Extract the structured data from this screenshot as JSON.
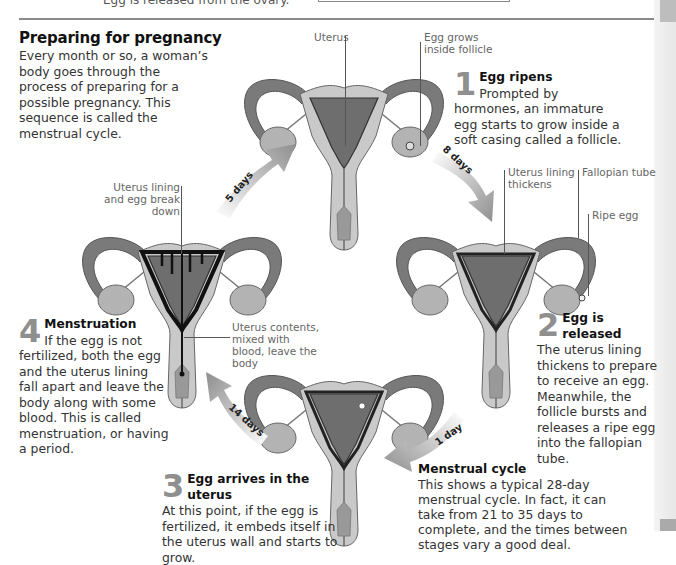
{
  "header": {
    "cut_text": "Egg is released from the ovary.",
    "title": "Preparing for pregnancy",
    "intro": "Every month or so, a woman’s body goes through the process of preparing for a possible pregnancy. This sequence is called the menstrual cycle."
  },
  "labels": {
    "uterus": "Uterus",
    "egg_grows": "Egg grows inside follicle",
    "lining_thickens": "Uterus lining thickens",
    "fallopian_tube": "Fallopian tube",
    "ripe_egg": "Ripe egg",
    "lining_breakdown": "Uterus lining and egg break down",
    "contents_leave": "Uterus contents, mixed with blood, leave the body"
  },
  "steps": [
    {
      "number": "1",
      "title": "Egg ripens",
      "body": "Prompted by hormones, an immature egg starts to grow inside a soft casing called a follicle."
    },
    {
      "number": "2",
      "title": "Egg is released",
      "body": "The uterus lining thickens to prepare to receive an egg. Meanwhile, the follicle bursts and releases a ripe egg into the fallopian tube."
    },
    {
      "number": "3",
      "title": "Egg arrives in the uterus",
      "body": "At this point, if the egg is fertilized, it embeds itself in the uterus wall and starts to grow."
    },
    {
      "number": "4",
      "title": "Menstruation",
      "body": "If the egg is not fertilized, both the egg and the uterus lining fall apart and leave the body along with some blood. This is called menstruation, or having a period."
    }
  ],
  "arrows": [
    {
      "label": "5 days",
      "from": "4",
      "to": "1"
    },
    {
      "label": "8 days",
      "from": "1",
      "to": "2"
    },
    {
      "label": "1 day",
      "from": "2",
      "to": "3"
    },
    {
      "label": "14 days",
      "from": "3",
      "to": "4"
    }
  ],
  "caption": {
    "title": "Menstrual cycle",
    "body": "This shows a typical 28-day menstrual cycle. In fact, it can take from 21 to 35 days to complete, and the times between stages vary a good deal."
  },
  "colors": {
    "tube": "#7a7a7a",
    "tissue": "#c9c9c9",
    "cavity": "#6e6e6e",
    "ovary": "#b3b3b3",
    "arrow": "#9a9a9a",
    "number": "#8f8f8f"
  }
}
